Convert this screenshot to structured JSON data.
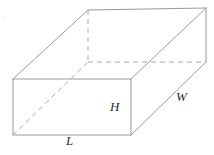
{
  "figure": {
    "background_color": "#ffffff",
    "stroke_color": "#9a9a9a",
    "hidden_stroke_color": "#a8a8a8",
    "label_color": "#2b2b2b",
    "stray_mark": "r"
  },
  "labels": {
    "length": "L",
    "height": "H",
    "width": "W"
  },
  "geometry": {
    "type": "cuboid",
    "projection": "oblique",
    "vertices": {
      "front_bottom_left": [
        13,
        135
      ],
      "front_bottom_right": [
        131,
        135
      ],
      "front_top_left": [
        13,
        79
      ],
      "front_top_right": [
        131,
        79
      ],
      "back_bottom_left": [
        88,
        62
      ],
      "back_bottom_right": [
        206,
        62
      ],
      "back_top_left": [
        88,
        10
      ],
      "back_top_right": [
        206,
        8
      ]
    },
    "visible_edges": [
      "front_bottom_left-front_bottom_right",
      "front_bottom_right-front_top_right",
      "front_top_right-front_top_left",
      "front_top_left-front_bottom_left",
      "front_top_left-back_top_left",
      "front_top_right-back_top_right",
      "back_top_left-back_top_right",
      "back_top_right-back_bottom_right",
      "front_bottom_right-back_bottom_right"
    ],
    "hidden_edges": [
      "back_bottom_left-back_top_left",
      "back_bottom_left-back_bottom_right",
      "back_bottom_left-front_bottom_left"
    ]
  }
}
